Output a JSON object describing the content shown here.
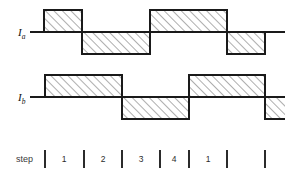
{
  "figure": {
    "title": "",
    "background": "#ffffff",
    "line_color": "#1a1a1a",
    "hatch_color": "#555555",
    "hatch_fill": "#ffffff",
    "width": 293,
    "height": 173
  },
  "traces": [
    {
      "id": "trace-ia",
      "label_main": "I",
      "label_sub": "a",
      "label_x": 18,
      "label_y": 36,
      "baseline_y": 32,
      "amplitude": 22,
      "axis_x_start": 30,
      "axis_x_end": 285,
      "segments": [
        {
          "x0": 30,
          "x1": 44,
          "level": 0
        },
        {
          "x0": 44,
          "x1": 82,
          "level": 1
        },
        {
          "x0": 82,
          "x1": 150,
          "level": -1
        },
        {
          "x0": 150,
          "x1": 227,
          "level": 1
        },
        {
          "x0": 227,
          "x1": 265,
          "level": -1
        },
        {
          "x0": 265,
          "x1": 285,
          "level": 0
        }
      ]
    },
    {
      "id": "trace-ib",
      "label_main": "I",
      "label_sub": "b",
      "label_x": 18,
      "label_y": 101,
      "baseline_y": 97,
      "amplitude": 22,
      "axis_x_start": 30,
      "axis_x_end": 285,
      "segments": [
        {
          "x0": 30,
          "x1": 45,
          "level": 0
        },
        {
          "x0": 45,
          "x1": 122,
          "level": 1
        },
        {
          "x0": 122,
          "x1": 189,
          "level": -1
        },
        {
          "x0": 189,
          "x1": 265,
          "level": 1
        },
        {
          "x0": 265,
          "x1": 285,
          "level": -1
        }
      ]
    }
  ],
  "step_axis": {
    "label": "step",
    "label_x": 16,
    "label_y": 162,
    "tick_y_top": 150,
    "tick_y_bottom": 168,
    "ticks": [
      45,
      84,
      122,
      160,
      189,
      227,
      265
    ],
    "cells": [
      {
        "label": "1",
        "x": 64
      },
      {
        "label": "2",
        "x": 103
      },
      {
        "label": "3",
        "x": 141
      },
      {
        "label": "4",
        "x": 174
      },
      {
        "label": "1",
        "x": 208
      }
    ]
  }
}
